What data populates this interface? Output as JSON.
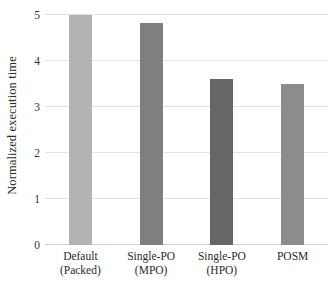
{
  "chart_data": {
    "type": "bar",
    "title": "",
    "xlabel": "",
    "ylabel": "Normalized execution time",
    "categories": [
      "Default (Packed)",
      "Single-PO\n(MPO)",
      "Single-PO\n(HPO)",
      "POSM"
    ],
    "values": [
      5.0,
      4.83,
      3.61,
      3.5
    ],
    "bar_colors": [
      "#b3b3b3",
      "#7f7f7f",
      "#666666",
      "#8c8c8c"
    ],
    "ylim": [
      0,
      5
    ],
    "yticks": [
      0,
      1,
      2,
      3,
      4,
      5
    ],
    "ytick_labels": [
      "0",
      "1",
      "2",
      "3",
      "4",
      "5"
    ],
    "grid": true,
    "grid_color": "#e3e3e3",
    "legend": null,
    "legend_position": "none",
    "background_color": "#ffffff"
  },
  "axis": {
    "y_title": "Normalized execution time"
  }
}
